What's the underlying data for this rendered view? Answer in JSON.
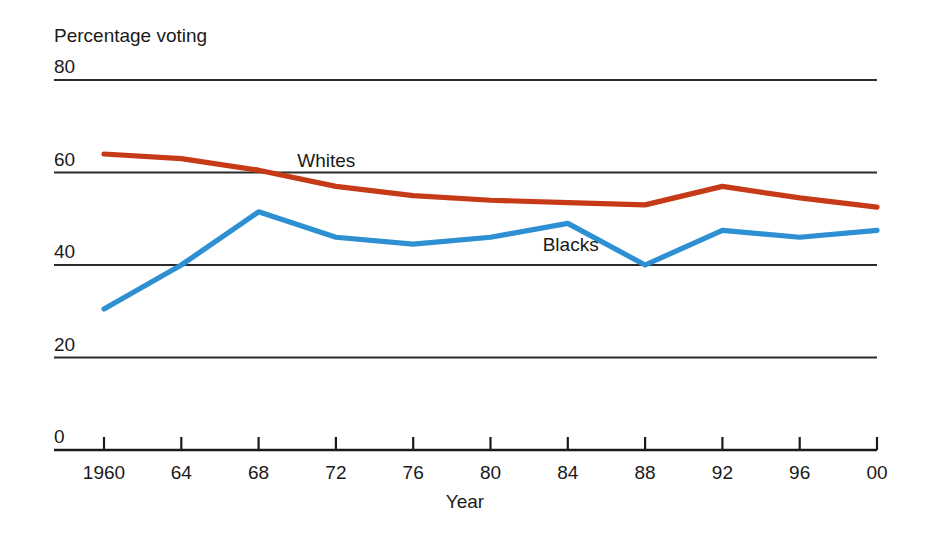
{
  "chart_data": {
    "type": "line",
    "title": "",
    "subtitle": "",
    "xlabel": "Year",
    "ylabel": "Percentage voting",
    "x": [
      1960,
      1964,
      1968,
      1972,
      1976,
      1980,
      1984,
      1988,
      1992,
      1996,
      2000
    ],
    "xtick_labels": [
      "1960",
      "64",
      "68",
      "72",
      "76",
      "80",
      "84",
      "88",
      "92",
      "96",
      "00"
    ],
    "ytick_labels": [
      "80",
      "60",
      "40",
      "20",
      "0"
    ],
    "yticks": [
      80,
      60,
      40,
      20,
      0
    ],
    "xlim": [
      1960,
      2000
    ],
    "ylim": [
      0,
      80
    ],
    "grid": "horizontal",
    "legend_position": "inline-annotations",
    "series": [
      {
        "name": "Whites",
        "color": "#c63a18",
        "values": [
          64,
          63,
          60.5,
          57,
          55,
          54,
          53.5,
          53,
          57,
          54.5,
          52.5
        ]
      },
      {
        "name": "Blacks",
        "color": "#2e90d2",
        "values": [
          30.5,
          40,
          51.5,
          46,
          44.5,
          46,
          49,
          40,
          47.5,
          46,
          47.5
        ]
      }
    ],
    "annotations": [
      {
        "text": "Whites",
        "x": 1970,
        "y": 62.5
      },
      {
        "text": "Blacks",
        "x": 1982.7,
        "y": 44.3
      }
    ]
  },
  "axis": {
    "y_title": "Percentage voting",
    "x_title": "Year"
  },
  "colors": {
    "whites_line": "#c63a18",
    "blacks_line": "#2e90d2",
    "gridline": "#2b2b2b",
    "axis": "#1a1a1a",
    "background": "#ffffff"
  }
}
